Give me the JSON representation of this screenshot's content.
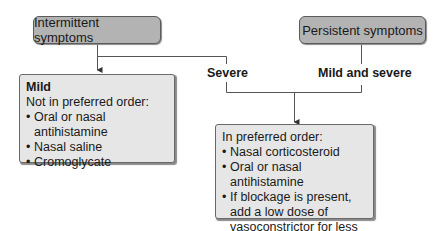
{
  "nodes": {
    "intermittent": {
      "label": "Intermittent symptoms"
    },
    "persistent": {
      "label": "Persistent symptoms"
    },
    "mild_box": {
      "title": "Mild",
      "subtitle": "Not in preferred order:",
      "items": [
        "Oral or nasal antihistamine",
        "Nasal saline",
        "Cromoglycate"
      ]
    },
    "treatment_box": {
      "subtitle": "In preferred order:",
      "items": [
        "Nasal corticosteroid",
        "Oral or nasal antihistamine",
        "If blockage is present, add a low dose of vasoconstrictor for less than 1 wk"
      ]
    }
  },
  "edge_labels": {
    "severe": "Severe",
    "mild_and_severe": "Mild and severe"
  },
  "colors": {
    "header_fill": "#b3b3b3",
    "box_fill": "#e6e6e6",
    "line": "#555555"
  }
}
